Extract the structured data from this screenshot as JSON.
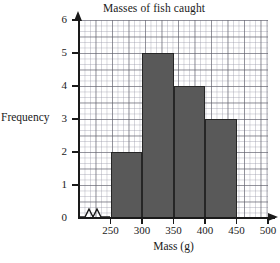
{
  "chart_data": {
    "type": "bar",
    "title": "Masses of fish caught",
    "xlabel": "Mass (g)",
    "ylabel": "Frequency",
    "grid": true,
    "legend": false,
    "x_axis_break": true,
    "xlim": [
      200,
      500
    ],
    "ylim": [
      0,
      6
    ],
    "bin_width": 50,
    "x_ticks": [
      250,
      300,
      350,
      400,
      450,
      500
    ],
    "x_tick_labels": [
      "250",
      "300",
      "350",
      "400",
      "450",
      "500"
    ],
    "y_ticks": [
      0,
      1,
      2,
      3,
      4,
      5,
      6
    ],
    "y_tick_labels": [
      "0",
      "1",
      "2",
      "3",
      "4",
      "5",
      "6"
    ],
    "categories": [
      "250-300",
      "300-350",
      "350-400",
      "400-450"
    ],
    "values": [
      2,
      5,
      4,
      3
    ],
    "bars": [
      {
        "label": "250-300",
        "x_start": 250,
        "x_end": 300,
        "value": 2
      },
      {
        "label": "300-350",
        "x_start": 300,
        "x_end": 350,
        "value": 5
      },
      {
        "label": "350-400",
        "x_start": 350,
        "x_end": 400,
        "value": 4
      },
      {
        "label": "400-450",
        "x_start": 400,
        "x_end": 450,
        "value": 3
      }
    ],
    "colors": {
      "bar_fill": "#595959",
      "bar_edge": "#262626",
      "axis": "#1a1a1a",
      "grid_major": "#5a5a64",
      "grid_minor": "#9696a5",
      "background": "#ffffff"
    }
  }
}
